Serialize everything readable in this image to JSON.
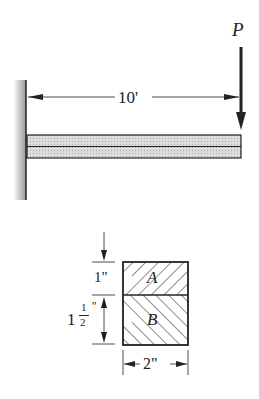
{
  "beam": {
    "length_label": "10'",
    "load_label": "P"
  },
  "section": {
    "top_label": "A",
    "bottom_label": "B",
    "top_height_label": "1\"",
    "bottom_height_whole": "1",
    "bottom_height_num": "1",
    "bottom_height_den": "2",
    "bottom_height_unit": "\"",
    "width_label": "2\""
  }
}
